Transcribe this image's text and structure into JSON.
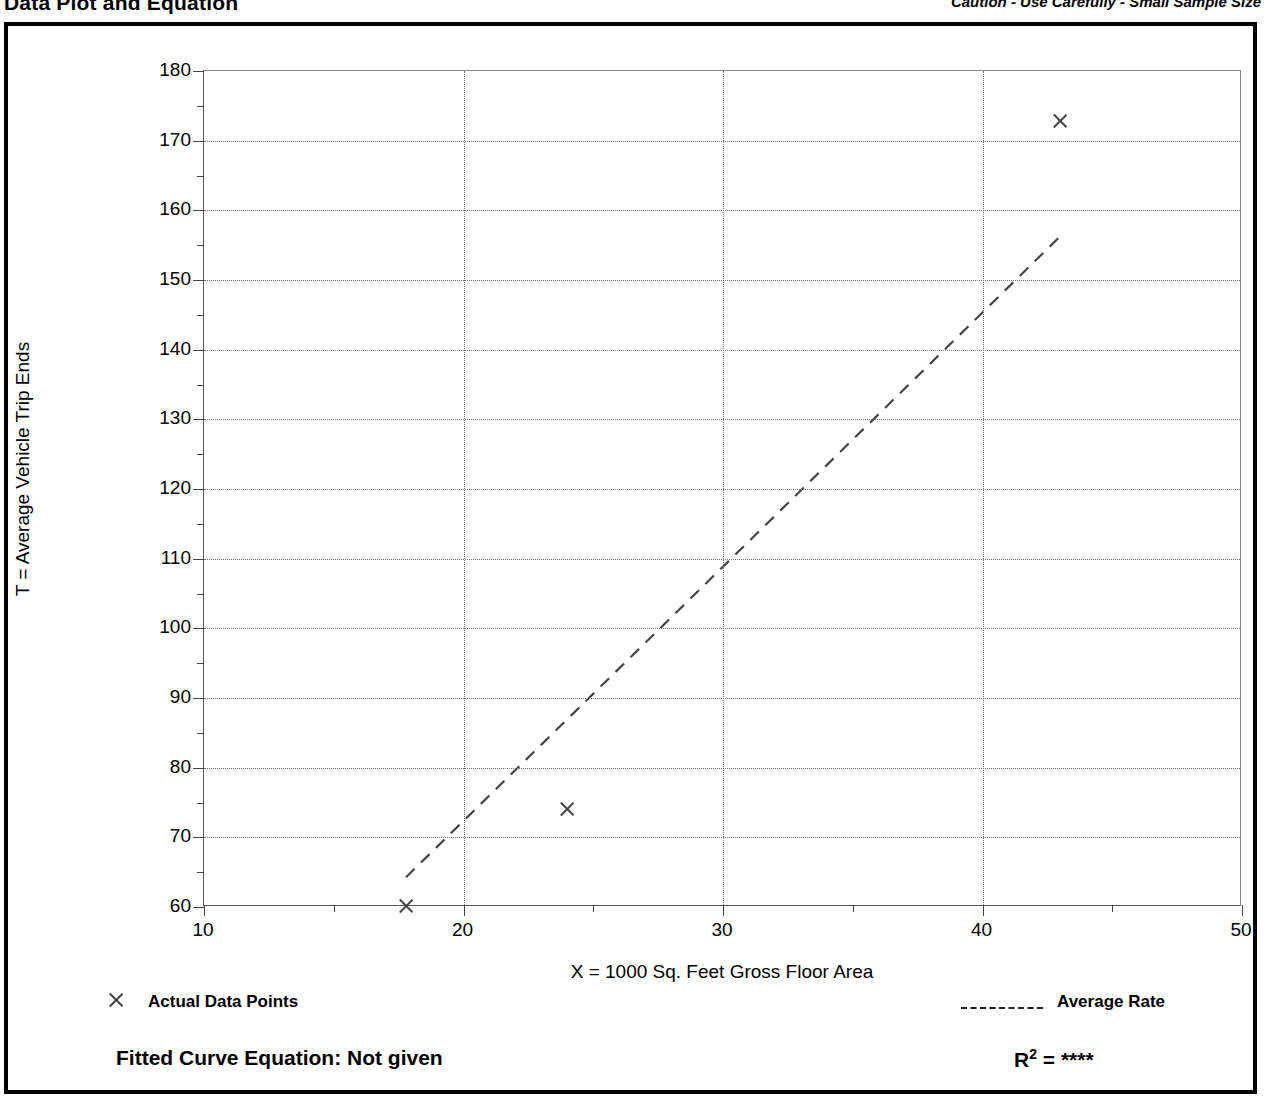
{
  "header": {
    "title": "Data Plot and Equation",
    "caution": "Caution - Use Carefully - Small Sample Size"
  },
  "legend": {
    "points_label": "Actual Data Points",
    "points_marker": "x-marker-icon",
    "line_label": "Average Rate",
    "line_marker": "dashed-line-icon"
  },
  "footer": {
    "equation_label": "Fitted Curve Equation:  Not given",
    "r2_base": "R",
    "r2_exponent": "2",
    "r2_equals": " = ",
    "r2_value": "****"
  },
  "chart_data": {
    "type": "scatter",
    "title": "Data Plot and Equation",
    "subtitle": "Caution - Use Carefully - Small Sample Size",
    "xlabel": "X = 1000 Sq. Feet Gross Floor Area",
    "ylabel": "T = Average Vehicle Trip Ends",
    "xlim": [
      10,
      50
    ],
    "ylim": [
      60,
      180
    ],
    "xticks": [
      10,
      20,
      30,
      40,
      50
    ],
    "xticks_minor": [
      15,
      25,
      35,
      45
    ],
    "yticks": [
      60,
      70,
      80,
      90,
      100,
      110,
      120,
      130,
      140,
      150,
      160,
      170,
      180
    ],
    "yticks_minor": [
      65,
      75,
      85,
      95,
      105,
      115,
      125,
      135,
      145,
      155,
      165,
      175
    ],
    "grid": true,
    "legend_position": "below-plot",
    "series": [
      {
        "name": "Actual Data Points",
        "type": "scatter",
        "marker": "x",
        "points": [
          {
            "x": 17.8,
            "y": 60.2
          },
          {
            "x": 24.0,
            "y": 74.0
          },
          {
            "x": 43.0,
            "y": 172.8
          }
        ]
      },
      {
        "name": "Average Rate",
        "type": "line",
        "style": "dashed",
        "points": [
          {
            "x": 17.8,
            "y": 64.0
          },
          {
            "x": 43.0,
            "y": 156.0
          }
        ]
      }
    ],
    "fitted_curve_equation": "Not given",
    "r_squared": "****"
  }
}
